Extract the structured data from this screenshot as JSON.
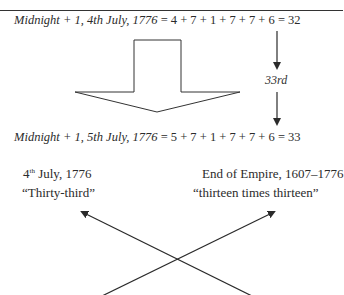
{
  "equations": [
    {
      "label": "Midnight + 1, 4th July, 1776",
      "sum": "= 4 + 7 + 1 + 7 + 7 + 6 = 32"
    },
    {
      "label": "Midnight + 1, 5th July, 1776",
      "sum": "= 5 + 7 + 1 + 7 + 7 + 6 = 33"
    }
  ],
  "annotation": "33rd",
  "left_block": {
    "line1_number": "4",
    "line1_sup": "th",
    "line1_rest": " July, 1776",
    "line2": "“Thirty-third”"
  },
  "right_block": {
    "line1": "End of Empire, 1607–1776",
    "line2": "“thirteen times thirteen”"
  },
  "colors": {
    "ink": "#2b2b2b",
    "background": "#ffffff"
  }
}
